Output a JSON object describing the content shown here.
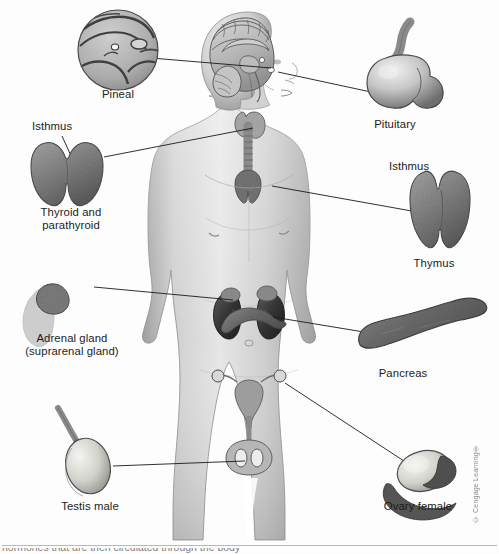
{
  "figure": {
    "background_color": "#fdfdfd",
    "line_color": "#1a1a1a",
    "text_color": "#1c1c1c",
    "palette": {
      "skin_light": "#e4e4e4",
      "skin_mid": "#c2c2c2",
      "skin_shadow": "#9a9a9a",
      "organ_dark": "#4a4a4a",
      "organ_mid": "#858585",
      "organ_light": "#bdbdbd",
      "kidney_dark": "#3b3b3b",
      "outline": "#2b2b2b"
    }
  },
  "labels": {
    "pineal": "Pineal",
    "isthmus_thyroid": "Isthmus",
    "thyroid": "Thyroid and\nparathyroid",
    "adrenal": "Adrenal gland\n(suprarenal gland)",
    "testis": "Testis male",
    "pituitary": "Pituitary",
    "isthmus_thymus": "Isthmus",
    "thymus": "Thymus",
    "pancreas": "Pancreas",
    "ovary": "Ovary female"
  },
  "credit": {
    "text": "© Cengage Learning®"
  },
  "footer": {
    "clipped_caption": "hormones that are then circulated through the body"
  },
  "callouts": [
    {
      "name": "pineal",
      "label": "Pineal",
      "side": "left",
      "inset_shape": "circular-brain-section",
      "leader_from": [
        151,
        58
      ],
      "leader_to": [
        271,
        68
      ]
    },
    {
      "name": "thyroid",
      "label": "Thyroid and parathyroid",
      "side": "left",
      "inset_shape": "butterfly-gland",
      "leader_from": [
        104,
        157
      ],
      "leader_to": [
        253,
        128
      ]
    },
    {
      "name": "adrenal",
      "label": "Adrenal gland (suprarenal gland)",
      "side": "left",
      "inset_shape": "lumpy-cap-on-kidney",
      "leader_from": [
        94,
        287
      ],
      "leader_to": [
        233,
        300
      ]
    },
    {
      "name": "testis",
      "label": "Testis male",
      "side": "left",
      "inset_shape": "oval-with-cord",
      "leader_from": [
        113,
        466
      ],
      "leader_to": [
        245,
        461
      ]
    },
    {
      "name": "pituitary",
      "label": "Pituitary",
      "side": "right",
      "inset_shape": "bulb-with-stalk",
      "leader_from": [
        385,
        95
      ],
      "leader_to": [
        278,
        72
      ]
    },
    {
      "name": "thymus",
      "label": "Thymus",
      "side": "right",
      "inset_shape": "bilobed-gland",
      "leader_from": [
        423,
        213
      ],
      "leader_to": [
        272,
        186
      ]
    },
    {
      "name": "pancreas",
      "label": "Pancreas",
      "side": "right",
      "inset_shape": "elongated-lumpy",
      "leader_from": [
        370,
        333
      ],
      "leader_to": [
        273,
        317
      ]
    },
    {
      "name": "ovary",
      "label": "Ovary female",
      "side": "right",
      "inset_shape": "oval-with-fimbriae",
      "leader_from": [
        407,
        463
      ],
      "leader_to": [
        285,
        383
      ]
    }
  ],
  "body_structures": [
    {
      "name": "brain-sagittal-section",
      "region": "head"
    },
    {
      "name": "pineal-gland-in-situ",
      "region": "head"
    },
    {
      "name": "pituitary-gland-in-situ",
      "region": "head"
    },
    {
      "name": "thyroid-gland-in-situ",
      "region": "neck"
    },
    {
      "name": "trachea",
      "region": "neck"
    },
    {
      "name": "thymus-in-situ",
      "region": "chest"
    },
    {
      "name": "kidney-left",
      "region": "abdomen"
    },
    {
      "name": "kidney-right",
      "region": "abdomen"
    },
    {
      "name": "adrenal-gland-in-situ",
      "region": "abdomen"
    },
    {
      "name": "pancreas-in-situ",
      "region": "abdomen"
    },
    {
      "name": "uterus-and-ovaries",
      "region": "pelvis"
    },
    {
      "name": "testes-and-scrotum",
      "region": "pelvis"
    }
  ]
}
